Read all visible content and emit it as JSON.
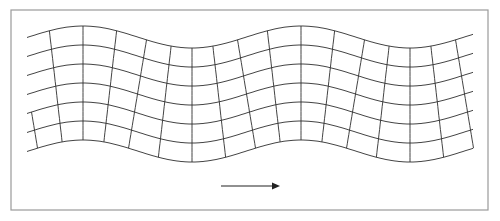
{
  "figure": {
    "frame": {
      "x": 11,
      "y": 10,
      "width": 477,
      "height": 200,
      "color": "#9a9a9a"
    },
    "line_color": "#2e2e2e",
    "wave": {
      "crest_x": 83,
      "wavelength": 218,
      "amplitude": 11,
      "top_line_mean_y": 37,
      "row_spacing": 19,
      "rows": 7,
      "x_start": 27,
      "x_end": 474,
      "column_spacing": 27.25,
      "column_displacement": 9
    },
    "arrow": {
      "label": "propagation-direction",
      "x1": 221,
      "x2": 280,
      "y": 186,
      "color": "#222222"
    }
  },
  "caption": {
    "text": ""
  }
}
